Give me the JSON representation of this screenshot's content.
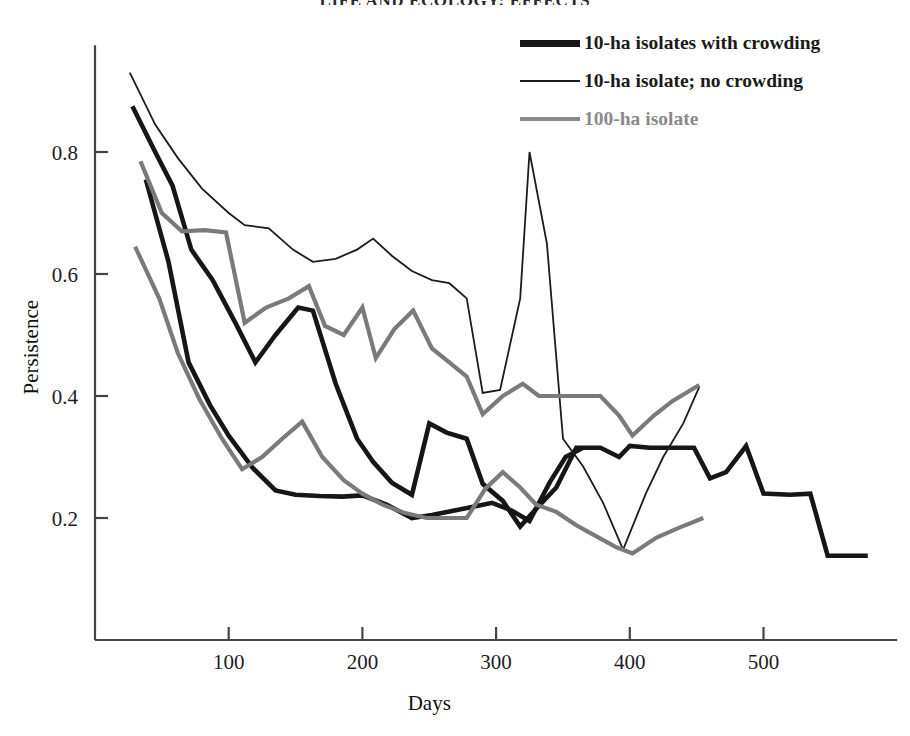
{
  "running_head": "LIFE AND ECOLOGY: EFFECTS",
  "chart_data": {
    "type": "line",
    "title": "",
    "subtitle": "",
    "xlabel": "Days",
    "ylabel": "Persistence",
    "xlim": [
      0,
      600
    ],
    "ylim": [
      0,
      1.0
    ],
    "xticks": [
      100,
      200,
      300,
      400,
      500
    ],
    "yticks": [
      0.2,
      0.4,
      0.6,
      0.8
    ],
    "xtick_labels": [
      "100",
      "200",
      "300",
      "400",
      "500"
    ],
    "ytick_labels": [
      "0.2",
      "0.4",
      "0.6",
      "0.8"
    ],
    "grid": false,
    "legend_position": "top-right",
    "colors": {
      "thick_black": "#161616",
      "thin_black": "#1c1c1c",
      "gray": "#7a7a7a"
    },
    "series": [
      {
        "name": "10-ha isolates with crowding",
        "style": "thick-black",
        "color": "#161616",
        "width": 4.6,
        "points": [
          [
            28,
            0.875
          ],
          [
            45,
            0.8
          ],
          [
            58,
            0.745
          ],
          [
            72,
            0.64
          ],
          [
            88,
            0.59
          ],
          [
            105,
            0.52
          ],
          [
            120,
            0.455
          ],
          [
            135,
            0.5
          ],
          [
            152,
            0.545
          ],
          [
            163,
            0.54
          ],
          [
            180,
            0.42
          ],
          [
            196,
            0.33
          ],
          [
            208,
            0.292
          ],
          [
            222,
            0.258
          ],
          [
            237,
            0.238
          ],
          [
            250,
            0.355
          ],
          [
            263,
            0.34
          ],
          [
            278,
            0.33
          ],
          [
            290,
            0.256
          ],
          [
            305,
            0.228
          ],
          [
            318,
            0.186
          ],
          [
            330,
            0.215
          ],
          [
            345,
            0.25
          ],
          [
            360,
            0.315
          ],
          [
            378,
            0.315
          ],
          [
            392,
            0.3
          ],
          [
            400,
            0.318
          ],
          [
            415,
            0.315
          ],
          [
            432,
            0.315
          ],
          [
            448,
            0.315
          ],
          [
            460,
            0.265
          ],
          [
            472,
            0.275
          ],
          [
            487,
            0.318
          ],
          [
            500,
            0.24
          ],
          [
            520,
            0.238
          ],
          [
            535,
            0.24
          ],
          [
            548,
            0.138
          ],
          [
            578,
            0.138
          ]
        ]
      },
      {
        "name": "10-ha isolates with crowding (second replicate)",
        "style": "thick-black",
        "color": "#161616",
        "width": 4.6,
        "points": [
          [
            38,
            0.755
          ],
          [
            55,
            0.62
          ],
          [
            70,
            0.455
          ],
          [
            86,
            0.385
          ],
          [
            100,
            0.335
          ],
          [
            118,
            0.282
          ],
          [
            135,
            0.245
          ],
          [
            150,
            0.238
          ],
          [
            168,
            0.236
          ],
          [
            185,
            0.235
          ],
          [
            200,
            0.237
          ],
          [
            218,
            0.222
          ],
          [
            237,
            0.2
          ],
          [
            252,
            0.205
          ],
          [
            268,
            0.212
          ],
          [
            282,
            0.218
          ],
          [
            297,
            0.225
          ],
          [
            312,
            0.212
          ],
          [
            325,
            0.195
          ],
          [
            340,
            0.258
          ],
          [
            352,
            0.3
          ],
          [
            365,
            0.315
          ]
        ]
      },
      {
        "name": "10-ha isolate; no crowding",
        "style": "thin-black",
        "color": "#1c1c1c",
        "width": 1.8,
        "points": [
          [
            26,
            0.93
          ],
          [
            45,
            0.845
          ],
          [
            62,
            0.79
          ],
          [
            80,
            0.74
          ],
          [
            100,
            0.7
          ],
          [
            112,
            0.68
          ],
          [
            130,
            0.675
          ],
          [
            148,
            0.64
          ],
          [
            163,
            0.62
          ],
          [
            180,
            0.625
          ],
          [
            196,
            0.64
          ],
          [
            208,
            0.658
          ],
          [
            222,
            0.63
          ],
          [
            237,
            0.605
          ],
          [
            252,
            0.59
          ],
          [
            265,
            0.585
          ],
          [
            278,
            0.56
          ],
          [
            290,
            0.405
          ],
          [
            303,
            0.41
          ],
          [
            318,
            0.56
          ],
          [
            325,
            0.8
          ],
          [
            338,
            0.65
          ],
          [
            350,
            0.33
          ],
          [
            365,
            0.285
          ],
          [
            380,
            0.225
          ],
          [
            395,
            0.148
          ],
          [
            412,
            0.24
          ],
          [
            425,
            0.3
          ],
          [
            440,
            0.355
          ],
          [
            452,
            0.415
          ]
        ]
      },
      {
        "name": "100-ha isolate",
        "style": "gray",
        "color": "#7a7a7a",
        "width": 4.2,
        "points": [
          [
            34,
            0.785
          ],
          [
            50,
            0.7
          ],
          [
            65,
            0.67
          ],
          [
            82,
            0.672
          ],
          [
            98,
            0.668
          ],
          [
            112,
            0.52
          ],
          [
            128,
            0.545
          ],
          [
            145,
            0.56
          ],
          [
            160,
            0.58
          ],
          [
            172,
            0.515
          ],
          [
            186,
            0.5
          ],
          [
            200,
            0.545
          ],
          [
            210,
            0.462
          ],
          [
            224,
            0.51
          ],
          [
            238,
            0.54
          ],
          [
            252,
            0.478
          ],
          [
            265,
            0.455
          ],
          [
            278,
            0.432
          ],
          [
            290,
            0.37
          ],
          [
            305,
            0.4
          ],
          [
            320,
            0.42
          ],
          [
            332,
            0.4
          ],
          [
            348,
            0.4
          ],
          [
            362,
            0.4
          ],
          [
            378,
            0.4
          ],
          [
            392,
            0.368
          ],
          [
            402,
            0.335
          ],
          [
            418,
            0.368
          ],
          [
            432,
            0.392
          ],
          [
            452,
            0.418
          ]
        ]
      },
      {
        "name": "100-ha isolate (second replicate)",
        "style": "gray",
        "color": "#7a7a7a",
        "width": 4.2,
        "points": [
          [
            30,
            0.645
          ],
          [
            48,
            0.56
          ],
          [
            62,
            0.47
          ],
          [
            78,
            0.395
          ],
          [
            95,
            0.33
          ],
          [
            110,
            0.28
          ],
          [
            125,
            0.3
          ],
          [
            140,
            0.33
          ],
          [
            155,
            0.358
          ],
          [
            170,
            0.3
          ],
          [
            186,
            0.262
          ],
          [
            200,
            0.24
          ],
          [
            215,
            0.222
          ],
          [
            232,
            0.208
          ],
          [
            248,
            0.2
          ],
          [
            262,
            0.2
          ],
          [
            278,
            0.2
          ],
          [
            292,
            0.248
          ],
          [
            305,
            0.275
          ],
          [
            318,
            0.25
          ],
          [
            330,
            0.222
          ],
          [
            345,
            0.21
          ],
          [
            360,
            0.188
          ],
          [
            375,
            0.17
          ],
          [
            390,
            0.152
          ],
          [
            402,
            0.142
          ],
          [
            420,
            0.168
          ],
          [
            438,
            0.185
          ],
          [
            455,
            0.2
          ]
        ]
      }
    ]
  },
  "legend": {
    "items": [
      {
        "label": "10-ha isolates with crowding",
        "style": "thick-black",
        "color": "#161616",
        "thickness": 7
      },
      {
        "label": "10-ha isolate; no crowding",
        "style": "thin-black",
        "color": "#1c1c1c",
        "thickness": 2
      },
      {
        "label": "100-ha isolate",
        "style": "gray",
        "color": "#8a8a8a",
        "thickness": 4
      }
    ]
  },
  "axes": {
    "y_title": "Persistence",
    "x_title": "Days"
  }
}
